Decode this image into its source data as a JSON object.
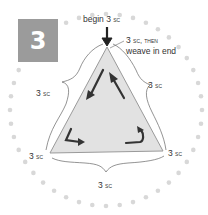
{
  "step": {
    "number": "3"
  },
  "labels": {
    "top_begin": "begin 3",
    "top_begin_sc": "sc",
    "top_end_line1": "3",
    "top_end_line1_sc": "sc, then",
    "top_end_line2": "weave in end",
    "left_side": "3",
    "right_side": "3",
    "bottom_left": "3",
    "bottom_right": "3",
    "bottom": "3",
    "sc": "sc"
  },
  "colors": {
    "step_box": "#9b9b9b",
    "triangle_fill": "#e2e2e2",
    "dots": "#d8d8d8",
    "arrows": "#333333",
    "text": "#333333"
  }
}
